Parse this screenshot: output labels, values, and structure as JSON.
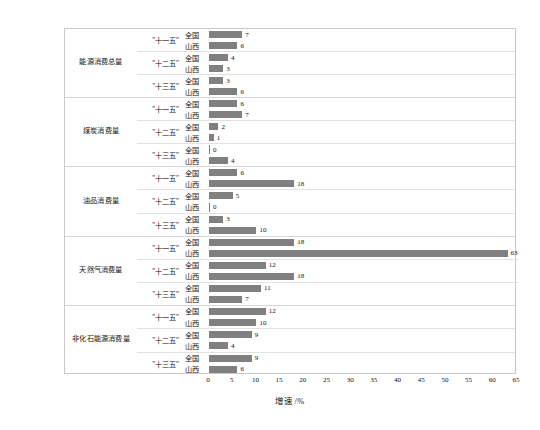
{
  "chart_data": {
    "type": "bar",
    "orientation": "horizontal",
    "title": "",
    "xlabel": "增速 /%",
    "ylabel": "",
    "xlim": [
      0,
      65
    ],
    "xticks": [
      0,
      5,
      10,
      15,
      20,
      25,
      30,
      35,
      40,
      45,
      50,
      55,
      60,
      65
    ],
    "grid": false,
    "legend": "none",
    "bar_color": "#808080",
    "categories": [
      "能源消费总量",
      "煤炭消费量",
      "油品消费量",
      "天然气消费量",
      "非化石能源消费量"
    ],
    "periods": [
      "\"十一五\"",
      "\"十二五\"",
      "\"十三五\""
    ],
    "regions": [
      "全国",
      "山西"
    ],
    "groups": [
      {
        "category": "能源消费总量",
        "periods": [
          {
            "label": "\"十一五\"",
            "rows": [
              {
                "region": "全国",
                "value": 7
              },
              {
                "region": "山西",
                "value": 6
              }
            ]
          },
          {
            "label": "\"十二五\"",
            "rows": [
              {
                "region": "全国",
                "value": 4
              },
              {
                "region": "山西",
                "value": 3
              }
            ]
          },
          {
            "label": "\"十三五\"",
            "rows": [
              {
                "region": "全国",
                "value": 3
              },
              {
                "region": "山西",
                "value": 6
              }
            ]
          }
        ]
      },
      {
        "category": "煤炭消费量",
        "periods": [
          {
            "label": "\"十一五\"",
            "rows": [
              {
                "region": "全国",
                "value": 6
              },
              {
                "region": "山西",
                "value": 7
              }
            ]
          },
          {
            "label": "\"十二五\"",
            "rows": [
              {
                "region": "全国",
                "value": 2
              },
              {
                "region": "山西",
                "value": 1
              }
            ]
          },
          {
            "label": "\"十三五\"",
            "rows": [
              {
                "region": "全国",
                "value": 0
              },
              {
                "region": "山西",
                "value": 4
              }
            ]
          }
        ]
      },
      {
        "category": "油品消费量",
        "periods": [
          {
            "label": "\"十一五\"",
            "rows": [
              {
                "region": "全国",
                "value": 6
              },
              {
                "region": "山西",
                "value": 18
              }
            ]
          },
          {
            "label": "\"十二五\"",
            "rows": [
              {
                "region": "全国",
                "value": 5
              },
              {
                "region": "山西",
                "value": 0
              }
            ]
          },
          {
            "label": "\"十三五\"",
            "rows": [
              {
                "region": "全国",
                "value": 3
              },
              {
                "region": "山西",
                "value": 10
              }
            ]
          }
        ]
      },
      {
        "category": "天然气消费量",
        "periods": [
          {
            "label": "\"十一五\"",
            "rows": [
              {
                "region": "全国",
                "value": 18
              },
              {
                "region": "山西",
                "value": 63
              }
            ]
          },
          {
            "label": "\"十二五\"",
            "rows": [
              {
                "region": "全国",
                "value": 12
              },
              {
                "region": "山西",
                "value": 18
              }
            ]
          },
          {
            "label": "\"十三五\"",
            "rows": [
              {
                "region": "全国",
                "value": 11
              },
              {
                "region": "山西",
                "value": 7
              }
            ]
          }
        ]
      },
      {
        "category": "非化石能源消费量",
        "periods": [
          {
            "label": "\"十一五\"",
            "rows": [
              {
                "region": "全国",
                "value": 12
              },
              {
                "region": "山西",
                "value": 10
              }
            ]
          },
          {
            "label": "\"十二五\"",
            "rows": [
              {
                "region": "全国",
                "value": 9
              },
              {
                "region": "山西",
                "value": 4
              }
            ]
          },
          {
            "label": "\"十三五\"",
            "rows": [
              {
                "region": "全国",
                "value": 9
              },
              {
                "region": "山西",
                "value": 6
              }
            ]
          }
        ]
      }
    ]
  }
}
